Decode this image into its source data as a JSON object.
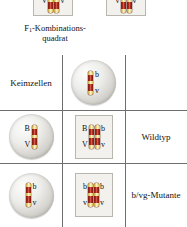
{
  "diagram": {
    "caption_line1": "F",
    "caption_sub": "1",
    "caption_line1_rest": "-Kombinations-",
    "caption_line2": "quadrat",
    "cross_symbol": "×",
    "corner_label": "Keimzellen"
  },
  "parents": {
    "left": {
      "name": "parent-genotype-left",
      "allele_left": "V",
      "allele_right": "v"
    },
    "right": {
      "name": "parent-genotype-right",
      "allele_left": "v",
      "allele_right": "v"
    }
  },
  "gametes": {
    "column_header": {
      "allele_top": "b",
      "allele_bottom": "v"
    },
    "row_1": {
      "allele_top": "B",
      "allele_bottom": "V"
    },
    "row_2": {
      "allele_top": "b",
      "allele_bottom": "v"
    }
  },
  "offspring": {
    "row_1": {
      "left_allele_top": "B",
      "left_allele_bottom": "V",
      "right_allele_top": "b",
      "right_allele_bottom": "v",
      "phenotype": "Wildtyp"
    },
    "row_2": {
      "left_allele_top": "b",
      "left_allele_bottom": "v",
      "right_allele_top": "b",
      "right_allele_bottom": "v",
      "phenotype": "b/vg-Mutante"
    }
  },
  "colors": {
    "chromosome_red": "#a8291b",
    "chromosome_band": "#e8d37a",
    "grid_line": "#6e6e6e",
    "box_fill": "#f2f1ee",
    "box_border": "#b9b6ae",
    "cell_gray": "#d4d2cd"
  }
}
